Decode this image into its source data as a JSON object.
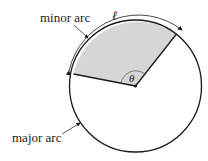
{
  "diagram": {
    "labels": {
      "minor_arc": "minor arc",
      "major_arc": "major arc",
      "arc_length": "ℓ",
      "angle": "θ"
    },
    "colors": {
      "sector_fill": "#d6d6d6",
      "stroke": "#1a1a1a"
    }
  }
}
